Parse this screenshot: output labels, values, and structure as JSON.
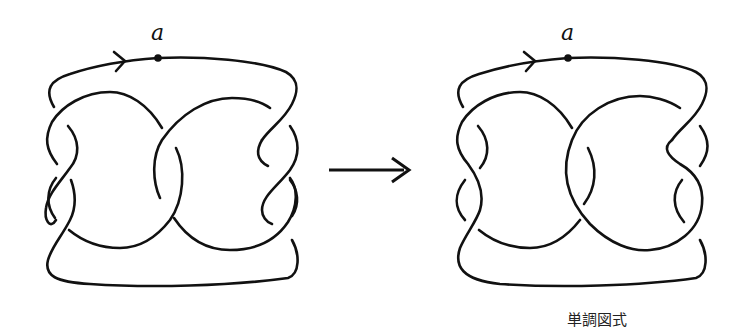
{
  "figure": {
    "left_diagram": {
      "basepoint_label": "a",
      "orientation": "arrow pointing right along top arc"
    },
    "transformation_arrow": "right-arrow",
    "right_diagram": {
      "basepoint_label": "a",
      "orientation": "arrow pointing right along top arc",
      "caption": "単調図式"
    }
  },
  "colors": {
    "stroke": "#111111",
    "background": "#ffffff"
  }
}
